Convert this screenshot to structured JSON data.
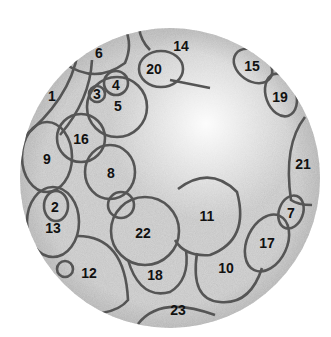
{
  "figure": {
    "colors": {
      "dish": "#c9c9c9",
      "outline": "#555555",
      "label": "#111111",
      "background": "#ffffff"
    },
    "regions": [
      {
        "id": "1",
        "label": "1",
        "lx": 52,
        "ly": 96
      },
      {
        "id": "2",
        "label": "2",
        "lx": 55,
        "ly": 207
      },
      {
        "id": "3",
        "label": "3",
        "lx": 97,
        "ly": 94
      },
      {
        "id": "4",
        "label": "4",
        "lx": 116,
        "ly": 85
      },
      {
        "id": "5",
        "label": "5",
        "lx": 118,
        "ly": 106
      },
      {
        "id": "6",
        "label": "6",
        "lx": 99,
        "ly": 53
      },
      {
        "id": "7",
        "label": "7",
        "lx": 291,
        "ly": 213
      },
      {
        "id": "8",
        "label": "8",
        "lx": 111,
        "ly": 173
      },
      {
        "id": "9",
        "label": "9",
        "lx": 47,
        "ly": 159
      },
      {
        "id": "10",
        "label": "10",
        "lx": 226,
        "ly": 268
      },
      {
        "id": "11",
        "label": "11",
        "lx": 207,
        "ly": 216
      },
      {
        "id": "12",
        "label": "12",
        "lx": 89,
        "ly": 273
      },
      {
        "id": "13",
        "label": "13",
        "lx": 53,
        "ly": 228
      },
      {
        "id": "14",
        "label": "14",
        "lx": 181,
        "ly": 46
      },
      {
        "id": "15",
        "label": "15",
        "lx": 252,
        "ly": 66
      },
      {
        "id": "16",
        "label": "16",
        "lx": 81,
        "ly": 139
      },
      {
        "id": "17",
        "label": "17",
        "lx": 267,
        "ly": 243
      },
      {
        "id": "18",
        "label": "18",
        "lx": 155,
        "ly": 275
      },
      {
        "id": "19",
        "label": "19",
        "lx": 280,
        "ly": 97
      },
      {
        "id": "20",
        "label": "20",
        "lx": 154,
        "ly": 69
      },
      {
        "id": "21",
        "label": "21",
        "lx": 303,
        "ly": 164
      },
      {
        "id": "22",
        "label": "22",
        "lx": 143,
        "ly": 233
      },
      {
        "id": "23",
        "label": "23",
        "lx": 178,
        "ly": 310
      }
    ]
  }
}
